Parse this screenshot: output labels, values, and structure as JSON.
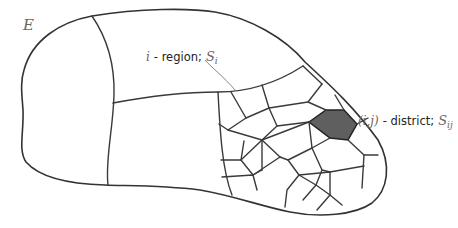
{
  "diagram": {
    "type": "region-partition",
    "set_label": "E",
    "region_label": {
      "index": "i",
      "text": "- region;",
      "symbol": "S",
      "subscript": "i"
    },
    "district_label": {
      "index": "(i,j)",
      "text": "- district;",
      "symbol": "S",
      "subscript": "ij"
    },
    "colors": {
      "stroke": "#333333",
      "district_fill": "#5f5f5f",
      "background": "#ffffff",
      "leader_line": "#777777"
    },
    "regions_count_visible": 4,
    "highlighted_district": "(i,j)"
  }
}
